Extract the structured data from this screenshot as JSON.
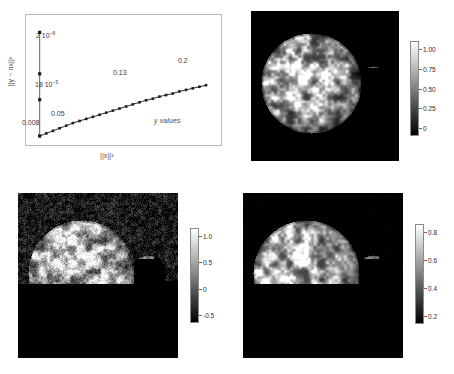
{
  "figure": {
    "background": "#ffffff",
    "panel_count": 4
  },
  "chart_data": {
    "type": "scatter",
    "title": "",
    "xlabel": "||x||²",
    "ylabel": "||y − nx||²",
    "series_annotation": "y values",
    "xlim": [
      0,
      0.22
    ],
    "ylim": [
      0,
      2.2e-06
    ],
    "grid": false,
    "legend": "none",
    "annotations": [
      {
        "text": "2 10",
        "exponent": "−6",
        "x": 0.008,
        "y": 2e-06,
        "label_id": "peak-upper"
      },
      {
        "text": "18 10",
        "exponent": "−5",
        "x": 0.008,
        "y": 7e-07,
        "label_id": "peak-lower"
      },
      {
        "text": "0.008",
        "x": 0.008,
        "y": 0.0,
        "label_id": "x-first"
      },
      {
        "text": "0.05",
        "x": 0.05,
        "y": 1.2e-07,
        "label_id": "x-second"
      },
      {
        "text": "0.13",
        "x": 0.13,
        "y": 5.5e-07,
        "label_id": "x-third"
      },
      {
        "text": "0.2",
        "x": 0.2,
        "y": 9e-07,
        "label_id": "x-fourth"
      }
    ],
    "vertical_series": {
      "name": "vertical spike at x=0.008",
      "x": [
        0.008,
        0.008,
        0.008,
        0.008
      ],
      "y": [
        2e-06,
        1.2e-06,
        7e-07,
        0.0
      ]
    },
    "trend_series": {
      "name": "y values",
      "x": [
        0.008,
        0.016,
        0.024,
        0.032,
        0.04,
        0.048,
        0.056,
        0.064,
        0.072,
        0.08,
        0.088,
        0.096,
        0.104,
        0.112,
        0.12,
        0.128,
        0.136,
        0.144,
        0.152,
        0.16,
        0.168,
        0.176,
        0.184,
        0.192,
        0.2,
        0.208
      ],
      "y": [
        0.0,
        5e-08,
        1e-07,
        1.5e-07,
        2e-07,
        2.5e-07,
        2.9e-07,
        3.3e-07,
        3.7e-07,
        4.1e-07,
        4.5e-07,
        4.9e-07,
        5.3e-07,
        5.7e-07,
        6.1e-07,
        6.5e-07,
        6.9e-07,
        7.2e-07,
        7.6e-07,
        7.9e-07,
        8.2e-07,
        8.6e-07,
        8.9e-07,
        9.2e-07,
        9.5e-07,
        9.8e-07
      ]
    }
  },
  "panels": {
    "top_right": {
      "name": "earth-and-moon-grayscale",
      "background": "#000000",
      "colorbar": {
        "ticks": [
          "1.00",
          "0.75",
          "0.50",
          "0.25",
          "0"
        ],
        "min_color": "#000000",
        "max_color": "#ffffff"
      }
    },
    "bottom_left": {
      "name": "earth-and-moon-noisy",
      "background": "#1a1a1a",
      "colorbar": {
        "ticks": [
          "1.0",
          "0.5",
          "0",
          "-0.5"
        ],
        "min_color": "#000000",
        "max_color": "#ffffff"
      }
    },
    "bottom_right": {
      "name": "earth-and-moon-reconstructed",
      "background": "#000000",
      "colorbar": {
        "ticks": [
          "0.8",
          "0.6",
          "0.4",
          "0.2"
        ],
        "min_color": "#000000",
        "max_color": "#ffffff"
      }
    }
  }
}
